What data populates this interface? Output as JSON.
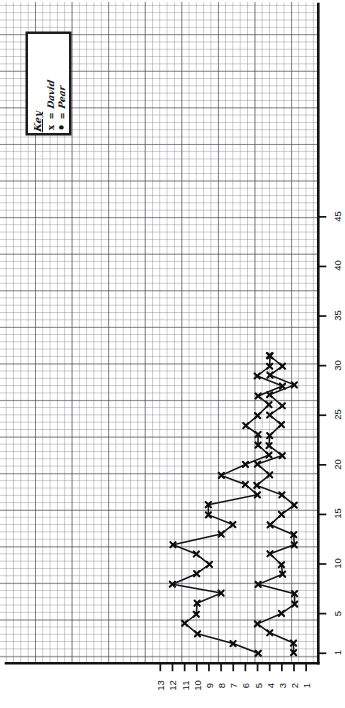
{
  "chart_data": {
    "type": "line",
    "title": "",
    "subtitle": "",
    "orientation": "rotated-90",
    "xlabel": "",
    "ylabel": "",
    "xlim": [
      0,
      48
    ],
    "ylim": [
      0,
      13.5
    ],
    "grid": true,
    "grid_minor_step": 1,
    "grid_major_step": 5,
    "legend": {
      "position": "top-left",
      "title": "Key",
      "entries": [
        {
          "symbol": "x",
          "equals": "=",
          "label": "David"
        },
        {
          "symbol": "•",
          "equals": "=",
          "label": "Pear"
        }
      ]
    },
    "x_ticks": [
      1,
      5,
      10,
      15,
      20,
      25,
      30,
      35,
      40,
      45
    ],
    "y_ticks": [
      1,
      2,
      3,
      4,
      5,
      6,
      7,
      8,
      9,
      10,
      11,
      12,
      13
    ],
    "series": [
      {
        "name": "David",
        "marker": "x",
        "points": [
          [
            1,
            2
          ],
          [
            2,
            2
          ],
          [
            3,
            4
          ],
          [
            4,
            5
          ],
          [
            5,
            3
          ],
          [
            6,
            2
          ],
          [
            7,
            2
          ],
          [
            8,
            5
          ],
          [
            9,
            3
          ],
          [
            10,
            3
          ],
          [
            11,
            4
          ],
          [
            12,
            2
          ],
          [
            13,
            2
          ],
          [
            14,
            4
          ],
          [
            15,
            3
          ],
          [
            16,
            2
          ],
          [
            17,
            3
          ],
          [
            18,
            5
          ],
          [
            19,
            4
          ],
          [
            20,
            5
          ],
          [
            21,
            3
          ],
          [
            22,
            4
          ],
          [
            23,
            4
          ],
          [
            24,
            3
          ],
          [
            25,
            4
          ],
          [
            26,
            3
          ],
          [
            27,
            4
          ],
          [
            28,
            2
          ],
          [
            29,
            4
          ],
          [
            30,
            3
          ],
          [
            31,
            4
          ]
        ]
      },
      {
        "name": "Pear",
        "marker": "x",
        "points": [
          [
            1,
            5
          ],
          [
            2,
            7
          ],
          [
            3,
            10
          ],
          [
            4,
            11
          ],
          [
            5,
            10
          ],
          [
            6,
            10
          ],
          [
            7,
            8
          ],
          [
            8,
            12
          ],
          [
            9,
            10
          ],
          [
            10,
            9
          ],
          [
            11,
            10
          ],
          [
            12,
            12
          ],
          [
            13,
            8
          ],
          [
            14,
            7
          ],
          [
            15,
            9
          ],
          [
            16,
            9
          ],
          [
            17,
            5
          ],
          [
            18,
            6
          ],
          [
            19,
            8
          ],
          [
            20,
            6
          ],
          [
            21,
            4
          ],
          [
            22,
            5
          ],
          [
            23,
            5
          ],
          [
            24,
            6
          ],
          [
            25,
            5
          ],
          [
            26,
            4
          ],
          [
            27,
            5
          ],
          [
            28,
            3
          ],
          [
            29,
            5
          ],
          [
            30,
            4
          ],
          [
            31,
            4
          ]
        ]
      }
    ]
  },
  "axes": {
    "bottom_labels": [
      "13",
      "12",
      "11",
      "10",
      "9",
      "8",
      "7",
      "6",
      "5",
      "4",
      "3",
      "2",
      "1"
    ],
    "right_labels": [
      "45",
      "40",
      "35",
      "30",
      "25",
      "20",
      "15",
      "10",
      "5",
      "1"
    ]
  }
}
